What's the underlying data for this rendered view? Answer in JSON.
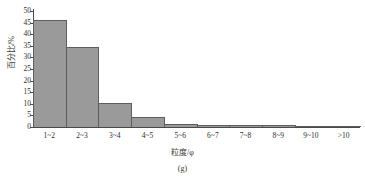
{
  "chart_data": {
    "type": "bar",
    "title": "",
    "subtitle": "",
    "caption": "(g)",
    "xlabel": "粒度/φ",
    "ylabel": "百分比/%",
    "categories": [
      "1~2",
      "2~3",
      "3~4",
      "4~5",
      "5~6",
      "6~7",
      "7~8",
      "8~9",
      "9~10",
      ">10"
    ],
    "values": [
      46,
      34.5,
      10.2,
      4.5,
      1.3,
      1.0,
      1.0,
      0.9,
      0.4,
      0.3
    ],
    "ylim": [
      0,
      50
    ],
    "yticks": [
      0,
      5,
      10,
      15,
      20,
      25,
      30,
      35,
      40,
      45,
      50
    ],
    "ytick_labels": [
      "0",
      "5",
      "10",
      "15",
      "20",
      "25",
      "30",
      "35",
      "40",
      "45",
      "50"
    ],
    "grid": false,
    "legend": null,
    "legend_position": "none",
    "series": [
      {
        "name": "百分比/%",
        "values": [
          46,
          34.5,
          10.2,
          4.5,
          1.3,
          1.0,
          1.0,
          0.9,
          0.4,
          0.3
        ]
      }
    ],
    "colors": {
      "bar_fill": "#9a9a9a",
      "bar_border": "#5d5d5d",
      "axis": "#4a4a4a",
      "text": "#2e2e2e",
      "background": "#ffffff"
    }
  }
}
